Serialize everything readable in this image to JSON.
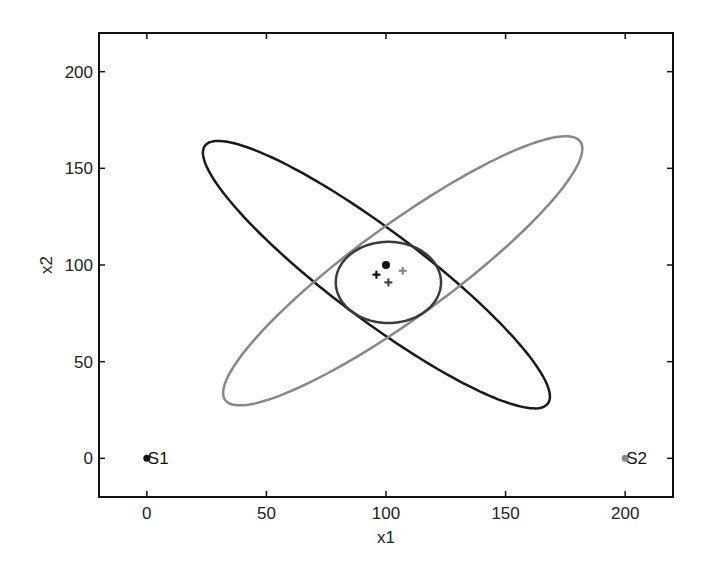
{
  "chart_data": {
    "type": "scatter",
    "title": "",
    "xlabel": "x1",
    "ylabel": "x2",
    "xlim": [
      -20,
      220
    ],
    "ylim": [
      -20,
      220
    ],
    "grid": false,
    "xticks": [
      0,
      50,
      100,
      150,
      200
    ],
    "yticks": [
      0,
      50,
      100,
      150,
      200
    ],
    "sources": [
      {
        "name": "S1",
        "x": 0,
        "y": 0,
        "color": "#111111"
      },
      {
        "name": "S2",
        "x": 200,
        "y": 0,
        "color": "#888888"
      }
    ],
    "markers": [
      {
        "name": "true-position",
        "shape": "dot",
        "x": 100,
        "y": 100,
        "color": "#111111"
      },
      {
        "name": "estimate-s1",
        "shape": "plus",
        "x": 96,
        "y": 95,
        "color": "#111111"
      },
      {
        "name": "estimate-fused",
        "shape": "plus",
        "x": 101,
        "y": 91,
        "color": "#444444"
      },
      {
        "name": "estimate-s2",
        "shape": "plus",
        "x": 107,
        "y": 97,
        "color": "#888888"
      }
    ],
    "ellipses": [
      {
        "name": "s1-covariance-ellipse",
        "cx": 96,
        "cy": 95,
        "semi_major": 98,
        "semi_minor": 21,
        "angle_deg": 136.5,
        "color": "#1a1a1a"
      },
      {
        "name": "s2-covariance-ellipse",
        "cx": 107,
        "cy": 97,
        "semi_major": 100,
        "semi_minor": 22,
        "angle_deg": 42.6,
        "color": "#888888"
      },
      {
        "name": "fused-covariance-ellipse",
        "cx": 101,
        "cy": 91,
        "semi_major": 22,
        "semi_minor": 21,
        "angle_deg": 0,
        "color": "#3a3a3a"
      }
    ]
  }
}
